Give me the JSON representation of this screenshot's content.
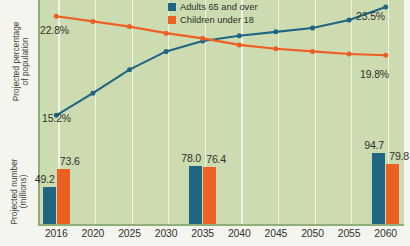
{
  "chart_data": {
    "type": "line",
    "title": "",
    "xlabel": "",
    "categories": [
      "2016",
      "2020",
      "2025",
      "2030",
      "2035",
      "2040",
      "2045",
      "2050",
      "2055",
      "2060"
    ],
    "grid": "vertical",
    "legend_position": "top-center",
    "panels": [
      {
        "id": "percentage",
        "type": "line",
        "ylabel_line1": "Projected percentage",
        "ylabel_line2": "of population",
        "ylim": [
          14.0,
          24.5
        ],
        "series": [
          {
            "name": "Adults 65 and over",
            "color": "#1f6683",
            "values": [
              15.2,
              16.9,
              18.7,
              20.1,
              20.9,
              21.3,
              21.6,
              21.9,
              22.5,
              23.5
            ],
            "labels": {
              "2016": "15.2%",
              "2060": "23.5%"
            }
          },
          {
            "name": "Children under 18",
            "color": "#ee5f24",
            "values": [
              22.8,
              22.4,
              22.0,
              21.5,
              21.1,
              20.6,
              20.3,
              20.1,
              19.9,
              19.8
            ],
            "labels": {
              "2016": "22.8%",
              "2060": "19.8%"
            }
          }
        ]
      },
      {
        "id": "millions",
        "type": "bar",
        "ylabel_line1": "Projected number",
        "ylabel_line2": "(millions)",
        "ylim": [
          0,
          100
        ],
        "bar_categories": [
          "2016",
          "2035",
          "2060"
        ],
        "series": [
          {
            "name": "Adults 65 and over",
            "color": "#1f6683",
            "values": [
              49.2,
              78.0,
              94.7
            ],
            "labels": [
              "49.2",
              "78.0",
              "94.7"
            ]
          },
          {
            "name": "Children under 18",
            "color": "#ee5f24",
            "values": [
              73.6,
              76.4,
              79.8
            ],
            "labels": [
              "73.6",
              "76.4",
              "79.8"
            ]
          }
        ]
      }
    ]
  },
  "legend": {
    "items": [
      {
        "label": "Adults 65 and over",
        "color": "#1f6683"
      },
      {
        "label": "Children under 18",
        "color": "#ee5f24"
      }
    ]
  },
  "axis_titles": {
    "top_line1": "Projected percentage",
    "top_line2": "of population",
    "bottom_line1": "Projected number",
    "bottom_line2": "(millions)"
  },
  "colors": {
    "adults": "#1f6683",
    "children": "#ee5f24",
    "plot_background": "#cddbb0",
    "gridline": "#eef3e2",
    "page_background": "#f4f5ee",
    "axis_line": "#8fae79"
  }
}
